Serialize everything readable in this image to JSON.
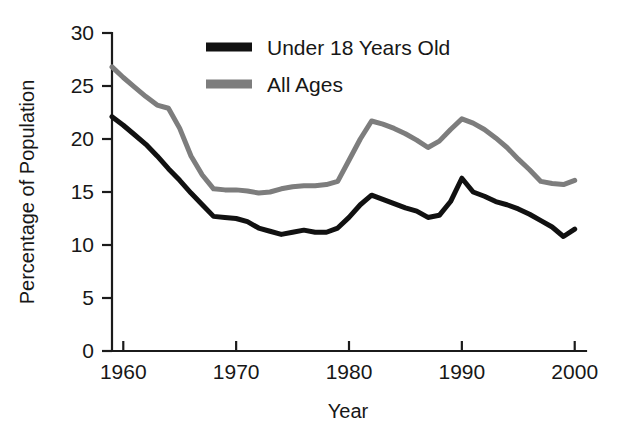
{
  "chart_data": {
    "type": "line",
    "title": "",
    "xlabel": "Year",
    "ylabel": "Percentage of Population",
    "xlim": [
      1959,
      2001
    ],
    "ylim": [
      0,
      30
    ],
    "grid": false,
    "legend_position": "top-center",
    "x_ticks": [
      "1960",
      "1970",
      "1980",
      "1990",
      "2000"
    ],
    "x_tick_values": [
      1960,
      1970,
      1980,
      1990,
      2000
    ],
    "y_ticks": [
      "0",
      "5",
      "10",
      "15",
      "20",
      "25",
      "30"
    ],
    "y_tick_values": [
      0,
      5,
      10,
      15,
      20,
      25,
      30
    ],
    "x": [
      1959,
      1960,
      1961,
      1962,
      1963,
      1964,
      1965,
      1966,
      1967,
      1968,
      1969,
      1970,
      1971,
      1972,
      1973,
      1974,
      1975,
      1976,
      1977,
      1978,
      1979,
      1980,
      1981,
      1982,
      1983,
      1984,
      1985,
      1986,
      1987,
      1988,
      1989,
      1990,
      1991,
      1992,
      1993,
      1994,
      1995,
      1996,
      1997,
      1998,
      1999,
      2000
    ],
    "series": [
      {
        "name": "Under 18 Years Old",
        "color": "#111111",
        "values": [
          22.1,
          21.3,
          20.4,
          19.5,
          18.4,
          17.2,
          16.1,
          14.9,
          13.8,
          12.7,
          12.6,
          12.5,
          12.2,
          11.6,
          11.3,
          11.0,
          11.2,
          11.4,
          11.2,
          11.2,
          11.6,
          12.6,
          13.8,
          14.7,
          14.3,
          13.9,
          13.5,
          13.2,
          12.6,
          12.8,
          14.1,
          16.3,
          15.0,
          14.6,
          14.1,
          13.8,
          13.4,
          12.9,
          12.3,
          11.7,
          10.8,
          11.5
        ]
      },
      {
        "name": "All Ages",
        "color": "#7d7d7d",
        "values": [
          26.8,
          25.8,
          24.9,
          24.0,
          23.2,
          22.9,
          21.0,
          18.4,
          16.6,
          15.3,
          15.2,
          15.2,
          15.1,
          14.9,
          15.0,
          15.3,
          15.5,
          15.6,
          15.6,
          15.7,
          16.0,
          18.0,
          20.0,
          21.7,
          21.4,
          21.0,
          20.5,
          19.9,
          19.2,
          19.8,
          20.9,
          21.9,
          21.5,
          20.9,
          20.1,
          19.2,
          18.1,
          17.1,
          16.0,
          15.8,
          15.7,
          16.1
        ]
      }
    ],
    "legend": [
      {
        "label": "Under 18 Years Old",
        "color": "#111111",
        "swatch": "thick-line"
      },
      {
        "label": "All Ages",
        "color": "#7d7d7d",
        "swatch": "thick-line"
      }
    ]
  },
  "colors": {
    "background": "#ffffff",
    "axis": "#1b1b1b",
    "text": "#171717",
    "series_under18": "#111111",
    "series_all_ages": "#7d7d7d"
  }
}
